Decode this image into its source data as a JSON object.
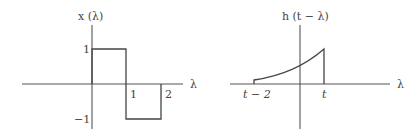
{
  "left_plot": {
    "title": "x (λ)",
    "axis_label": "λ",
    "ticks": {
      "x_1": "1",
      "x_2": "2",
      "y_1": "1",
      "y_neg1": "−1"
    },
    "signal": "rectangular: +1 on [0,1], −1 on [1,2]"
  },
  "right_plot": {
    "title": "h (t − λ)",
    "axis_label": "λ",
    "ticks": {
      "start": "t − 2",
      "end": "t"
    },
    "signal": "rising exponential segment from t−2 to t"
  },
  "colors": {
    "line": "#444444",
    "axis": "#555555",
    "background": "#ffffff"
  }
}
